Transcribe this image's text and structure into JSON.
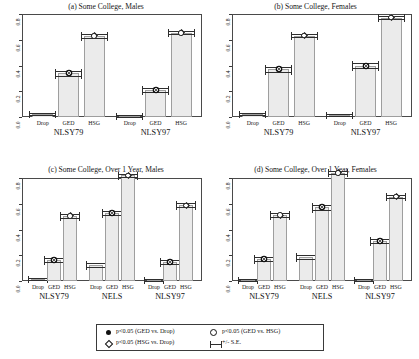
{
  "figure": {
    "ylabels": [
      "0.0",
      "0.2",
      "0.4",
      "0.6",
      "0.8"
    ],
    "category_labels": [
      "Drop",
      "GED",
      "HSG"
    ]
  },
  "legend": {
    "items": [
      {
        "symbol": "filled-circle",
        "text": "p<0.05 (GED vs. Drop)"
      },
      {
        "symbol": "open-circle",
        "text": "p<0.05 (GED vs. HSG)"
      },
      {
        "symbol": "open-diamond",
        "text": "p<0.05 (HSG vs. Drop)"
      },
      {
        "symbol": "error-bar",
        "text": "+/- S.E."
      }
    ]
  },
  "chart_data": [
    {
      "type": "bar",
      "panel": "a",
      "title": "(a) Some College, Males",
      "xlabel": "",
      "ylabel": "",
      "ylim": [
        0.0,
        0.8
      ],
      "yticks": [
        0.0,
        0.2,
        0.4,
        0.6,
        0.8
      ],
      "grid": false,
      "groups": [
        "NLSY79",
        "NLSY97"
      ],
      "categories": [
        "Drop",
        "GED",
        "HSG"
      ],
      "series": [
        {
          "name": "NLSY79",
          "values": [
            0.021,
            0.338,
            0.63
          ],
          "se": [
            0.006,
            0.018,
            0.014
          ],
          "markers": [
            "none",
            "filled-circle",
            "open-diamond"
          ]
        },
        {
          "name": "NLSY97",
          "values": [
            0.01,
            0.213,
            0.654
          ],
          "se": [
            0.005,
            0.016,
            0.013
          ],
          "markers": [
            "none",
            "filled-circle",
            "open-diamond"
          ]
        }
      ]
    },
    {
      "type": "bar",
      "panel": "b",
      "title": "(b) Some College, Females",
      "xlabel": "",
      "ylabel": "",
      "ylim": [
        0.0,
        0.8
      ],
      "yticks": [
        0.0,
        0.2,
        0.4,
        0.6,
        0.8
      ],
      "grid": false,
      "groups": [
        "NLSY79",
        "NLSY97"
      ],
      "categories": [
        "Drop",
        "GED",
        "HSG"
      ],
      "series": [
        {
          "name": "NLSY79",
          "values": [
            0.022,
            0.37,
            0.632
          ],
          "se": [
            0.006,
            0.018,
            0.013
          ],
          "markers": [
            "none",
            "filled-circle",
            "open-diamond"
          ]
        },
        {
          "name": "NLSY97",
          "values": [
            0.012,
            0.399,
            0.772
          ],
          "se": [
            0.005,
            0.017,
            0.012
          ],
          "markers": [
            "none",
            "filled-circle",
            "open-diamond"
          ]
        }
      ]
    },
    {
      "type": "bar",
      "panel": "c",
      "title": "(c) Some College, Over 1 Year, Males",
      "xlabel": "",
      "ylabel": "",
      "ylim": [
        0.0,
        0.8
      ],
      "yticks": [
        0.0,
        0.2,
        0.4,
        0.6,
        0.8
      ],
      "grid": false,
      "groups": [
        "NLSY79",
        "NELS",
        "NLSY97"
      ],
      "categories": [
        "Drop",
        "GED",
        "HSG"
      ],
      "series": [
        {
          "name": "NLSY79",
          "values": [
            0.018,
            0.163,
            0.505
          ],
          "se": [
            0.006,
            0.016,
            0.014
          ],
          "markers": [
            "none",
            "filled-circle",
            "open-diamond"
          ]
        },
        {
          "name": "NELS",
          "values": [
            0.122,
            0.528,
            0.82
          ],
          "se": [
            0.014,
            0.019,
            0.012
          ],
          "markers": [
            "none",
            "filled-circle",
            "open-diamond"
          ]
        },
        {
          "name": "NLSY97",
          "values": [
            0.011,
            0.145,
            0.588
          ],
          "se": [
            0.005,
            0.016,
            0.014
          ],
          "markers": [
            "none",
            "filled-circle",
            "open-diamond"
          ]
        }
      ]
    },
    {
      "type": "bar",
      "panel": "d",
      "title": "(d) Some College, Over 1 Year, Females",
      "xlabel": "",
      "ylabel": "",
      "ylim": [
        0.0,
        0.8
      ],
      "yticks": [
        0.0,
        0.2,
        0.4,
        0.6,
        0.8
      ],
      "grid": false,
      "groups": [
        "NLSY79",
        "NELS",
        "NLSY97"
      ],
      "categories": [
        "Drop",
        "GED",
        "HSG"
      ],
      "series": [
        {
          "name": "NLSY79",
          "values": [
            0.008,
            0.172,
            0.512
          ],
          "se": [
            0.004,
            0.016,
            0.014
          ],
          "markers": [
            "none",
            "filled-circle",
            "open-diamond"
          ]
        },
        {
          "name": "NELS",
          "values": [
            0.185,
            0.572,
            0.84
          ],
          "se": [
            0.016,
            0.018,
            0.011
          ],
          "markers": [
            "none",
            "filled-circle",
            "open-diamond"
          ]
        },
        {
          "name": "NLSY97",
          "values": [
            0.009,
            0.31,
            0.655
          ],
          "se": [
            0.004,
            0.017,
            0.013
          ],
          "markers": [
            "none",
            "filled-circle",
            "open-diamond"
          ]
        }
      ]
    }
  ]
}
